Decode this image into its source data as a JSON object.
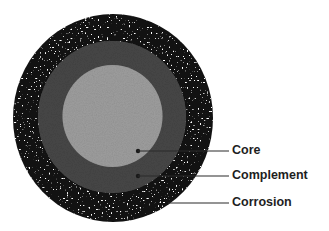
{
  "diagram": {
    "type": "concentric-circles",
    "colors": {
      "corrosion": "#121212",
      "complement": "#474747",
      "core": "#9e9e9e",
      "speckle": "#ffffff",
      "leader_line": "#2a2a2a",
      "label_text": "#1e1e1e"
    },
    "layers": [
      {
        "name": "Corrosion",
        "label": "Corrosion"
      },
      {
        "name": "Complement",
        "label": "Complement"
      },
      {
        "name": "Core",
        "label": "Core"
      }
    ],
    "labels": {
      "core": "Core",
      "complement": "Complement",
      "corrosion": "Corrosion"
    }
  }
}
